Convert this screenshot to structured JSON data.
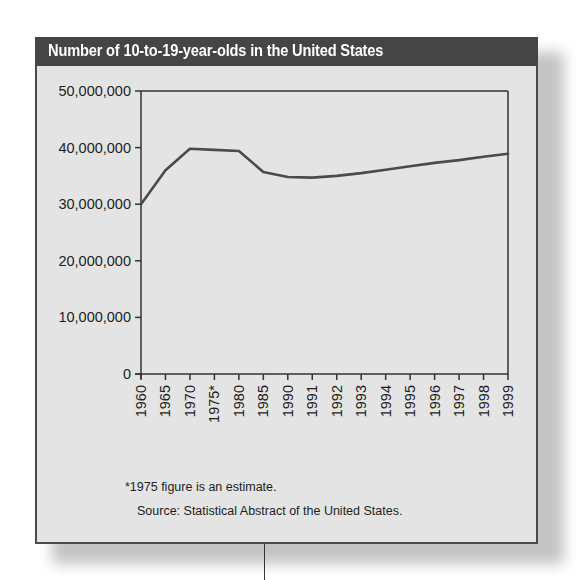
{
  "chart_data": {
    "type": "line",
    "title": "Number of 10-to-19-year-olds in the United States",
    "xlabel": "",
    "ylabel": "",
    "categories": [
      "1960",
      "1965",
      "1970",
      "1975*",
      "1980",
      "1985",
      "1990",
      "1991",
      "1992",
      "1993",
      "1994",
      "1995",
      "1996",
      "1997",
      "1998",
      "1999"
    ],
    "series": [
      {
        "name": "10-to-19-year-olds",
        "values": [
          30000000,
          36000000,
          39800000,
          39600000,
          39400000,
          35700000,
          34800000,
          34700000,
          35000000,
          35500000,
          36100000,
          36700000,
          37300000,
          37800000,
          38400000,
          38900000
        ]
      }
    ],
    "y_ticks": [
      "0",
      "10,000,000",
      "20,000,000",
      "30,000,000",
      "40,000,000",
      "50,000,000"
    ],
    "ylim": [
      0,
      50000000
    ],
    "grid": false,
    "legend": "none",
    "annotations": [
      "*1975 figure is an estimate.",
      "Source: Statistical Abstract of the United States."
    ]
  },
  "header": {
    "title": "Number of 10-to-19-year-olds in the United States"
  },
  "footer": {
    "footnote": "*1975 figure is an estimate.",
    "source": "Source: Statistical Abstract of the United States."
  },
  "colors": {
    "title_bar": "#454545",
    "panel": "#e4e4e4",
    "line": "#4a4a4a",
    "axis": "#333333"
  }
}
